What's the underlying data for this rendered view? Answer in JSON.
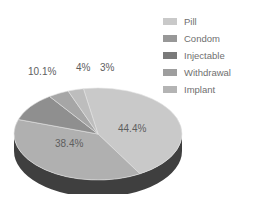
{
  "chart_data": {
    "type": "pie",
    "title": "",
    "subtitle": "",
    "xlabel": "",
    "ylabel": "",
    "grid": false,
    "legend_position": "right",
    "three_d": true,
    "categories": [
      "Pill",
      "Condom",
      "Injectable",
      "Withdrawal",
      "Implant"
    ],
    "values": [
      44.4,
      38.4,
      10.1,
      4,
      3
    ],
    "labels": [
      "44.4%",
      "38.4%",
      "10.1%",
      "4%",
      "3%"
    ],
    "colors": [
      "#c9c9c9",
      "#b0b0b0",
      "#8f8f8f",
      "#a6a6a6",
      "#bdbdbd"
    ],
    "side_color": "#3f3f3f",
    "label_color": "#5e5e5e"
  },
  "legend": {
    "items": [
      {
        "label": "Pill",
        "color": "#c9c9c9"
      },
      {
        "label": "Condom",
        "color": "#989898"
      },
      {
        "label": "Injectable",
        "color": "#7a7a7a"
      },
      {
        "label": "Withdrawal",
        "color": "#9e9e9e"
      },
      {
        "label": "Implant",
        "color": "#b4b4b4"
      }
    ]
  },
  "pie_labels": {
    "pill": "44.4%",
    "condom": "38.4%",
    "injectable": "10.1%",
    "withdrawal": "4%",
    "implant": "3%"
  }
}
